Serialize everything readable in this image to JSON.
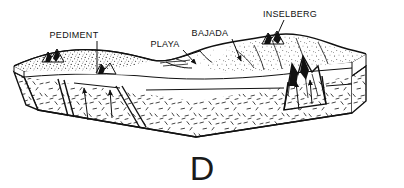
{
  "figure": {
    "panel_letter": "D",
    "title": "",
    "background_color": "#ffffff",
    "ink_color": "#111111",
    "type": "geological block diagram"
  },
  "labels": [
    {
      "id": "pediment",
      "text": "PEDIMENT",
      "text_x": 74,
      "text_y": 38,
      "leader": {
        "x1": 97,
        "y1": 41,
        "x2": 97,
        "y2": 72
      },
      "arrow": false
    },
    {
      "id": "playa",
      "text": "PLAYA",
      "text_x": 165,
      "text_y": 47,
      "leader": {
        "x1": 183,
        "y1": 50,
        "x2": 196,
        "y2": 64
      },
      "arrow": true
    },
    {
      "id": "bajada",
      "text": "BAJADA",
      "text_x": 210,
      "text_y": 36,
      "leader": {
        "x1": 232,
        "y1": 39,
        "x2": 241,
        "y2": 61
      },
      "arrow": true
    },
    {
      "id": "inselberg",
      "text": "INSELBERG",
      "text_x": 258,
      "text_y": 17,
      "leader": {
        "x1": 284,
        "y1": 20,
        "x2": 275,
        "y2": 40
      },
      "arrow": false
    }
  ],
  "landforms": {
    "pediment_surface": "stippled gently-sloping erosional bedrock surface on the left",
    "playa_basin": "flat closed depression in the center of the basin",
    "bajada_apron": "coalesced alluvial fans sloping from the range front",
    "inselberg_peak": "isolated residual hill rising above the pediment",
    "mountain_peaks_count": 4,
    "fault_count": 3
  },
  "colors": {
    "ink": "#111111",
    "background": "#ffffff",
    "stipple": "#1a1a1a",
    "bedrock_hatch": "#222222"
  }
}
